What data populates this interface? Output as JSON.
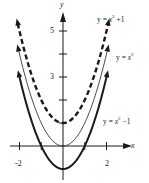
{
  "chart_data": {
    "type": "line",
    "title": "",
    "xlabel": "x",
    "ylabel": "y",
    "xlim": [
      -2.2,
      2.4
    ],
    "ylim": [
      -1.5,
      6
    ],
    "grid": false,
    "legend_position": "inline labels at right",
    "x_ticks": [
      -2,
      -1,
      1,
      2
    ],
    "x_tick_labels": [
      "-2",
      "2"
    ],
    "y_ticks": [
      1,
      2,
      3,
      4,
      5
    ],
    "y_tick_labels": [
      "3",
      "5"
    ],
    "series": [
      {
        "name": "y = x² + 1",
        "style": "dashed-thick",
        "x": [
          -2,
          -1.5,
          -1,
          -0.5,
          0,
          0.5,
          1,
          1.5,
          2
        ],
        "values": [
          5,
          3.25,
          2,
          1.25,
          1,
          1.25,
          2,
          3.25,
          5
        ]
      },
      {
        "name": "y = x²",
        "style": "thin",
        "x": [
          -2,
          -1.5,
          -1,
          -0.5,
          0,
          0.5,
          1,
          1.5,
          2
        ],
        "values": [
          4,
          2.25,
          1,
          0.25,
          0,
          0.25,
          1,
          2.25,
          4
        ]
      },
      {
        "name": "y = x² − 1",
        "style": "solid-thick",
        "x": [
          -2,
          -1.5,
          -1,
          -0.5,
          0,
          0.5,
          1,
          1.5,
          2
        ],
        "values": [
          3,
          1.25,
          0,
          -0.75,
          -1,
          -0.75,
          0,
          1.25,
          3
        ]
      }
    ]
  },
  "labels": {
    "y_axis": "y",
    "x_axis": "x",
    "tick_y5": "5",
    "tick_y3": "3",
    "tick_xm2": "-2",
    "tick_x2": "2",
    "curve_upper_prefix": "y = ",
    "curve_upper_var": "x",
    "curve_upper_exp": "2",
    "curve_upper_suffix": " +1",
    "curve_mid_prefix": "y = ",
    "curve_mid_var": "x",
    "curve_mid_exp": "2",
    "curve_lower_prefix": "y = ",
    "curve_lower_var": "x",
    "curve_lower_exp": "2",
    "curve_lower_suffix": " −1"
  },
  "colors": {
    "ink": "#1a1a1a",
    "background": "#ffffff"
  }
}
